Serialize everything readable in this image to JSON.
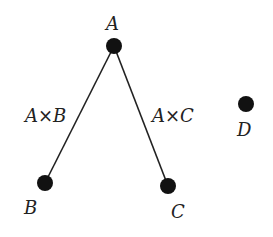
{
  "diagram": {
    "type": "graph",
    "nodes": [
      {
        "id": "A",
        "label": "A",
        "x": 114,
        "y": 46
      },
      {
        "id": "B",
        "label": "B",
        "x": 45,
        "y": 183
      },
      {
        "id": "C",
        "label": "C",
        "x": 168,
        "y": 186
      },
      {
        "id": "D",
        "label": "D",
        "x": 246,
        "y": 104
      }
    ],
    "edges": [
      {
        "from": "A",
        "to": "B",
        "label": "A×B"
      },
      {
        "from": "A",
        "to": "C",
        "label": "A×C"
      }
    ],
    "colors": {
      "node": "#111111",
      "edge": "#222222",
      "text": "#222222"
    }
  }
}
